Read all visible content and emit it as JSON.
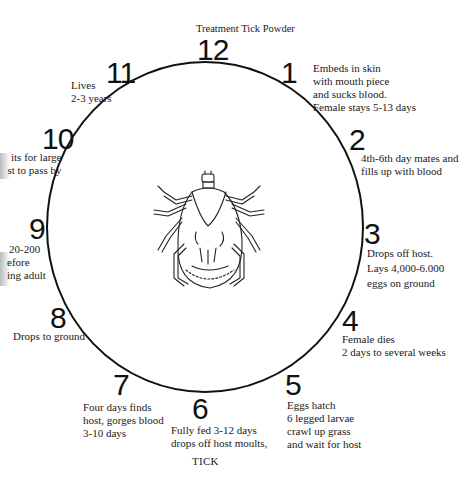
{
  "diagram": {
    "title": "Treatment Tick Powder",
    "caption": "TICK",
    "center_illustration": "tick-illustration",
    "stages": [
      {
        "number": "12",
        "lines": []
      },
      {
        "number": "1",
        "lines": [
          "Embeds in skin",
          "with mouth piece",
          "and sucks blood.",
          "Female stays 5-13 days"
        ]
      },
      {
        "number": "2",
        "lines": [
          "4th-6th day mates and",
          "fills up with blood"
        ]
      },
      {
        "number": "3",
        "lines": [
          "Drops off host.",
          "Lays 4,000-6.000",
          "eggs on ground"
        ]
      },
      {
        "number": "4",
        "lines": [
          "Female dies",
          "2 days to several weeks"
        ]
      },
      {
        "number": "5",
        "lines": [
          "Eggs hatch",
          "6 legged larvae",
          "crawl up grass",
          "and wait for host"
        ]
      },
      {
        "number": "6",
        "lines": [
          "Fully fed 3-12 days",
          "drops off host moults,"
        ]
      },
      {
        "number": "7",
        "lines": [
          "Four days finds",
          "host, gorges blood",
          "3-10 days"
        ]
      },
      {
        "number": "8",
        "lines": [
          "Drops to ground"
        ]
      },
      {
        "number": "9",
        "lines": [
          "20-200",
          "efore",
          "ing adult"
        ]
      },
      {
        "number": "10",
        "lines": [
          "its for large",
          "st to pass by"
        ]
      },
      {
        "number": "11",
        "lines": [
          "Lives",
          "2-3 years"
        ]
      }
    ]
  }
}
